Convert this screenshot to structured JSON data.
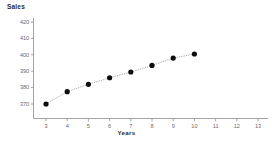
{
  "chart_data": {
    "type": "scatter",
    "title": "Sales",
    "xlabel": "Years",
    "ylabel": "Sales",
    "grid": false,
    "legend": null,
    "xlim": [
      2.5,
      13.5
    ],
    "ylim": [
      365,
      424
    ],
    "xticks": [
      "3",
      "4",
      "5",
      "6",
      "7",
      "8",
      "9",
      "10",
      "11",
      "12",
      "13"
    ],
    "yticks": [
      "420",
      "410",
      "400",
      "390",
      "380",
      "370"
    ],
    "marker": "filled-circle",
    "marker_color": "#0d0d0d",
    "line_style": "dotted",
    "line_color": "#8c8c8c",
    "x": [
      3,
      4,
      5,
      6,
      7,
      8,
      9,
      10
    ],
    "values": [
      370,
      377.5,
      382,
      386,
      389.5,
      393.5,
      398,
      400.5
    ],
    "points": [
      {
        "x": 3,
        "y": 370
      },
      {
        "x": 4,
        "y": 377.5
      },
      {
        "x": 5,
        "y": 382
      },
      {
        "x": 6,
        "y": 386
      },
      {
        "x": 7,
        "y": 389.5
      },
      {
        "x": 8,
        "y": 393.5
      },
      {
        "x": 9,
        "y": 398
      },
      {
        "x": 10,
        "y": 400.5
      }
    ]
  },
  "axes": {
    "axis_color": "#9a9a9a",
    "tick_color": "#9a9a9a"
  }
}
